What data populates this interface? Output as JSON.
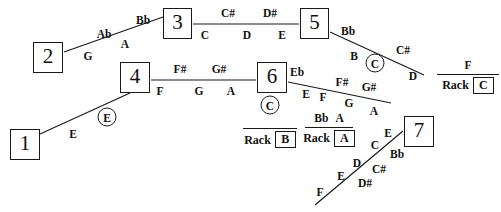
{
  "diagram": {
    "stroke_color": "#1a1a1a",
    "background_color": "#ffffff",
    "nodes": [
      {
        "id": "node-1",
        "label": "1",
        "x": 10,
        "y": 129,
        "w": 30,
        "h": 31
      },
      {
        "id": "node-2",
        "label": "2",
        "x": 33,
        "y": 42,
        "w": 30,
        "h": 31
      },
      {
        "id": "node-3",
        "label": "3",
        "x": 163,
        "y": 8,
        "w": 29,
        "h": 31
      },
      {
        "id": "node-4",
        "label": "4",
        "x": 120,
        "y": 62,
        "w": 30,
        "h": 31
      },
      {
        "id": "node-5",
        "label": "5",
        "x": 300,
        "y": 8,
        "w": 29,
        "h": 31
      },
      {
        "id": "node-6",
        "label": "6",
        "x": 257,
        "y": 62,
        "w": 30,
        "h": 31
      },
      {
        "id": "node-7",
        "label": "7",
        "x": 404,
        "y": 116,
        "w": 30,
        "h": 31
      }
    ],
    "edges": [
      {
        "id": "edge-2-3",
        "x1": 64,
        "y1": 52,
        "x2": 163,
        "y2": 17
      },
      {
        "id": "edge-3-5",
        "x1": 193,
        "y1": 24,
        "x2": 299,
        "y2": 24
      },
      {
        "id": "edge-5-down",
        "x1": 330,
        "y1": 32,
        "x2": 424,
        "y2": 75
      },
      {
        "id": "edge-4-6",
        "x1": 151,
        "y1": 80,
        "x2": 256,
        "y2": 80
      },
      {
        "id": "edge-1-4",
        "x1": 40,
        "y1": 134,
        "x2": 130,
        "y2": 93
      },
      {
        "id": "edge-6-down",
        "x1": 288,
        "y1": 82,
        "x2": 391,
        "y2": 103
      },
      {
        "id": "edge-7-up",
        "x1": 315,
        "y1": 205,
        "x2": 403,
        "y2": 131
      }
    ],
    "notes": [
      {
        "id": "note-ab",
        "label": "Ab",
        "x": 104,
        "y": 35
      },
      {
        "id": "note-bb-1",
        "label": "Bb",
        "x": 143,
        "y": 21
      },
      {
        "id": "note-g-1",
        "label": "G",
        "x": 88,
        "y": 57
      },
      {
        "id": "note-a-1",
        "label": "A",
        "x": 125,
        "y": 45
      },
      {
        "id": "note-csharp-1",
        "label": "C#",
        "x": 228,
        "y": 14
      },
      {
        "id": "note-dsharp-1",
        "label": "D#",
        "x": 270,
        "y": 14
      },
      {
        "id": "note-c-1",
        "label": "C",
        "x": 205,
        "y": 36
      },
      {
        "id": "note-d-1",
        "label": "D",
        "x": 247,
        "y": 36
      },
      {
        "id": "note-e-1",
        "label": "E",
        "x": 282,
        "y": 36
      },
      {
        "id": "note-bb-2",
        "label": "Bb",
        "x": 348,
        "y": 32
      },
      {
        "id": "note-csharp-2",
        "label": "C#",
        "x": 403,
        "y": 51
      },
      {
        "id": "note-b-1",
        "label": "B",
        "x": 354,
        "y": 57
      },
      {
        "id": "note-d-2",
        "label": "D",
        "x": 413,
        "y": 77
      },
      {
        "id": "note-fsharp-1",
        "label": "F#",
        "x": 180,
        "y": 70
      },
      {
        "id": "note-gsharp-1",
        "label": "G#",
        "x": 219,
        "y": 70
      },
      {
        "id": "note-f-1",
        "label": "F",
        "x": 160,
        "y": 92
      },
      {
        "id": "note-g-2",
        "label": "G",
        "x": 199,
        "y": 92
      },
      {
        "id": "note-a-2",
        "label": "A",
        "x": 231,
        "y": 92
      },
      {
        "id": "note-eb-1",
        "label": "Eb",
        "x": 297,
        "y": 73
      },
      {
        "id": "note-fsharp-2",
        "label": "F#",
        "x": 342,
        "y": 83
      },
      {
        "id": "note-gsharp-2",
        "label": "G#",
        "x": 369,
        "y": 88
      },
      {
        "id": "note-e-2",
        "label": "E",
        "x": 306,
        "y": 95
      },
      {
        "id": "note-f-2",
        "label": "F",
        "x": 323,
        "y": 98
      },
      {
        "id": "note-g-3",
        "label": "G",
        "x": 349,
        "y": 104
      },
      {
        "id": "note-a-3",
        "label": "A",
        "x": 374,
        "y": 112
      },
      {
        "id": "note-e-3",
        "label": "E",
        "x": 73,
        "y": 135
      },
      {
        "id": "note-e-4",
        "label": "E",
        "x": 388,
        "y": 134
      },
      {
        "id": "note-c-2",
        "label": "C",
        "x": 375,
        "y": 146
      },
      {
        "id": "note-bb-3",
        "label": "Bb",
        "x": 397,
        "y": 155
      },
      {
        "id": "note-d-3",
        "label": "D",
        "x": 357,
        "y": 164
      },
      {
        "id": "note-csharp-3",
        "label": "C#",
        "x": 379,
        "y": 170
      },
      {
        "id": "note-e-5",
        "label": "E",
        "x": 341,
        "y": 177
      },
      {
        "id": "note-dsharp-2",
        "label": "D#",
        "x": 365,
        "y": 184
      },
      {
        "id": "note-f-3",
        "label": "F",
        "x": 320,
        "y": 193
      }
    ],
    "circled_notes": [
      {
        "id": "circled-e",
        "label": "E",
        "x": 107,
        "y": 117
      },
      {
        "id": "circled-c-top",
        "label": "C",
        "x": 375,
        "y": 63
      },
      {
        "id": "circled-c-rack-b",
        "label": "C",
        "x": 270,
        "y": 105
      }
    ],
    "racks": [
      {
        "id": "rack-c",
        "numerator": [
          "F"
        ],
        "word": "Rack",
        "box_letter": "C",
        "x": 437,
        "y": 60,
        "width": 62
      },
      {
        "id": "rack-b",
        "numerator": [],
        "word": "Rack",
        "box_letter": "B",
        "x": 243,
        "y": 114,
        "width": 54
      },
      {
        "id": "rack-a",
        "numerator": [
          "Bb",
          "A"
        ],
        "word": "Rack",
        "box_letter": "A",
        "x": 305,
        "y": 113,
        "width": 48
      }
    ]
  }
}
